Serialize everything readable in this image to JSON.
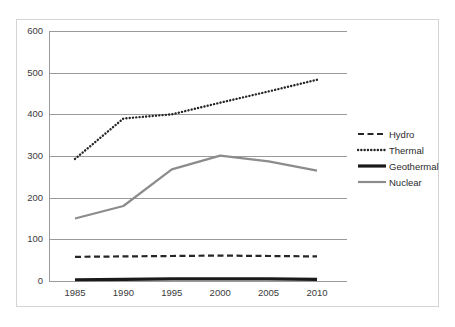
{
  "chart_data": {
    "type": "line",
    "title": "",
    "xlabel": "",
    "ylabel": "",
    "x": [
      1985,
      1990,
      1995,
      2000,
      2005,
      2010
    ],
    "xtick_labels": [
      "1985",
      "1990",
      "1995",
      "2000",
      "2005",
      "2010"
    ],
    "ytick_labels": [
      "0",
      "100",
      "200",
      "300",
      "400",
      "500",
      "600"
    ],
    "yticks": [
      0,
      100,
      200,
      300,
      400,
      500,
      600
    ],
    "ylim": [
      0,
      600
    ],
    "xlim": [
      1983,
      2012
    ],
    "grid": "horizontal",
    "legend_position": "right",
    "series": [
      {
        "name": "Hydro",
        "values": [
          58,
          59,
          60,
          61,
          60,
          59
        ],
        "style": "dashed",
        "color": "#262626",
        "width": 2.2
      },
      {
        "name": "Thermal",
        "values": [
          293,
          390,
          400,
          428,
          455,
          483
        ],
        "style": "dotted",
        "color": "#262626",
        "width": 2.4
      },
      {
        "name": "Geothermal",
        "values": [
          3,
          4,
          5,
          5,
          5,
          4
        ],
        "style": "solid",
        "color": "#1a1a1a",
        "width": 3.2
      },
      {
        "name": "Nuclear",
        "values": [
          150,
          180,
          268,
          301,
          287,
          265
        ],
        "style": "solid",
        "color": "#8c8c8c",
        "width": 2.2
      }
    ]
  },
  "legend": {
    "items": [
      {
        "label": "Hydro"
      },
      {
        "label": "Thermal"
      },
      {
        "label": "Geothermal"
      },
      {
        "label": "Nuclear"
      }
    ]
  }
}
